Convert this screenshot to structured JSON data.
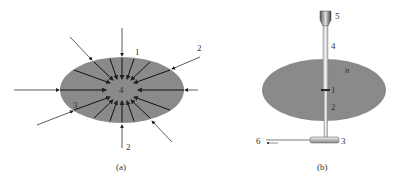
{
  "figure": {
    "panel_a": {
      "caption": "(a)",
      "labels": {
        "top": "1",
        "right_top": "2",
        "center": "4",
        "left_bottom": "3",
        "bottom": "2"
      }
    },
    "panel_b": {
      "caption": "(b)",
      "labels": {
        "cap_top": "5",
        "tube_upper": "4",
        "medium": "n",
        "junction": "1",
        "tube_lower": "2",
        "base": "3",
        "outlet": "6"
      }
    },
    "colors": {
      "ellipse_fill": "#8a8a8a",
      "arrow": "#222222",
      "background": "#ffffff"
    }
  }
}
